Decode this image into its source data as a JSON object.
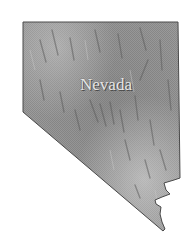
{
  "map": {
    "state_name": "Nevada",
    "label": "Nevada",
    "colors": {
      "background": "#ffffff",
      "fill_base": "#9a9a9a",
      "fill_light": "#c4c4c4",
      "fill_dark": "#5e5e5e",
      "outline": "#4a4a4a",
      "label": "#e6e6e6"
    }
  }
}
